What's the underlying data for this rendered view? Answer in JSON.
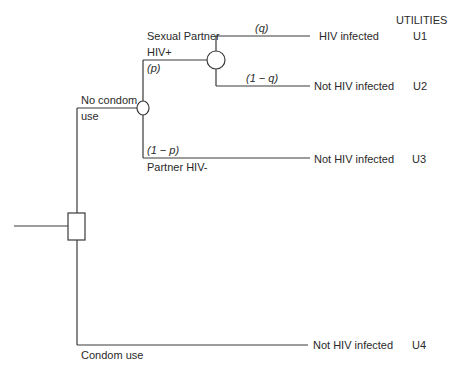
{
  "diagram": {
    "type": "decision-tree",
    "utilities_header": "UTILITIES",
    "decision_node": {
      "shape": "square"
    },
    "branches": {
      "no_condom": {
        "label_line1": "No condom",
        "label_line2": "use"
      },
      "condom": {
        "label": "Condom use"
      },
      "partner_pos": {
        "label_line1": "Sexual Partner",
        "label_line2": "HIV+",
        "prob": "(p)"
      },
      "partner_neg": {
        "label": "Partner HIV-",
        "prob": "(1 − p)"
      },
      "infected": {
        "prob": "(q)"
      },
      "not_infected": {
        "prob": "(1 − q)"
      }
    },
    "outcomes": [
      {
        "label": "HIV infected",
        "utility": "U1"
      },
      {
        "label": "Not HIV infected",
        "utility": "U2"
      },
      {
        "label": "Not HIV infected",
        "utility": "U3"
      },
      {
        "label": "Not HIV infected",
        "utility": "U4"
      }
    ],
    "line_color": "#3a3a3a"
  }
}
